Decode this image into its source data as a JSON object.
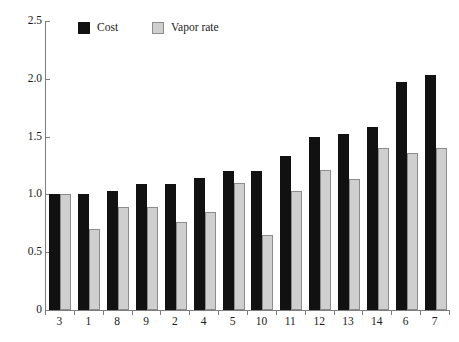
{
  "chart_data": {
    "type": "bar",
    "title": "",
    "subtitle": "",
    "xlabel": "",
    "ylabel": "",
    "categories": [
      "3",
      "1",
      "8",
      "9",
      "2",
      "4",
      "5",
      "10",
      "11",
      "12",
      "13",
      "14",
      "6",
      "7"
    ],
    "series": [
      {
        "name": "Cost",
        "color": "#111111",
        "values": [
          1.0,
          1.0,
          1.03,
          1.09,
          1.09,
          1.14,
          1.2,
          1.2,
          1.33,
          1.5,
          1.52,
          1.58,
          1.97,
          2.03
        ]
      },
      {
        "name": "Vapor rate",
        "color": "#cfcfcf",
        "values": [
          1.0,
          0.7,
          0.89,
          0.89,
          0.76,
          0.85,
          1.1,
          0.65,
          1.03,
          1.21,
          1.13,
          1.4,
          1.36,
          1.4
        ]
      }
    ],
    "ylim": [
      0,
      2.5
    ],
    "ytick_values": [
      0,
      0.5,
      1.0,
      1.5,
      2.0,
      2.5
    ],
    "ytick_labels": [
      "0",
      "0.5",
      "1.0",
      "1.5",
      "2.0",
      "2.5"
    ],
    "grid": false,
    "legend_position": "top-left-inside",
    "legend": [
      "Cost",
      "Vapor rate"
    ],
    "annotations": []
  }
}
